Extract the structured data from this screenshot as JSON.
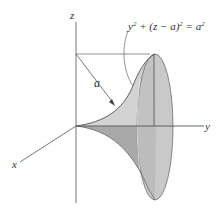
{
  "figure": {
    "axes": {
      "x_label": "x",
      "y_label": "y",
      "z_label": "z"
    },
    "radius_label": "a",
    "equation": {
      "base": "y",
      "exp1": "2",
      "middle": " + (z − a)",
      "exp2": "2",
      "eq": " = a",
      "exp3": "2"
    },
    "colors": {
      "axis": "#555555",
      "surface_light": "#d4d4d4",
      "surface_dark": "#a9a9a9",
      "ellipse_fill": "#c2c2c2",
      "outline": "#6e6e6e"
    }
  }
}
